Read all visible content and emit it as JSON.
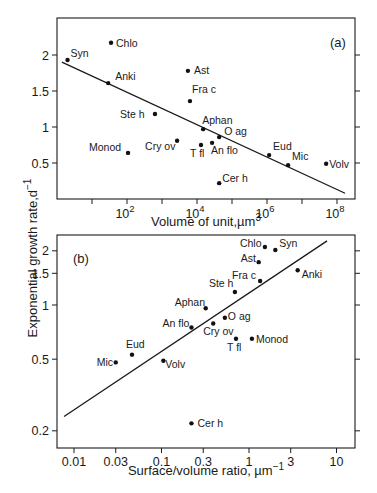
{
  "figure": {
    "y_axis_title": "Exponential growth rate,d",
    "y_axis_title_sup": "−1"
  },
  "chart_data": [
    {
      "type": "scatter",
      "panel": "(a)",
      "title": "",
      "xlabel": "Volume of unit,µm",
      "xlabel_sup": "3",
      "ylabel": "Exponential growth rate, d^-1",
      "xscale": "log",
      "yscale": "linear",
      "xlim_log10": [
        0.0,
        8.5
      ],
      "ylim": [
        0.05,
        2.5
      ],
      "x_ticks_log10": [
        1,
        2,
        3,
        4,
        5,
        6,
        7,
        8
      ],
      "x_tick_labels": [
        {
          "log10": 2,
          "base": "10",
          "exp": "2"
        },
        {
          "log10": 4,
          "base": "10",
          "exp": "4"
        },
        {
          "log10": 6,
          "base": "10",
          "exp": "6"
        },
        {
          "log10": 8,
          "base": "10",
          "exp": "8"
        }
      ],
      "y_ticks": [
        0.5,
        1,
        1.5,
        2
      ],
      "y_tick_labels": [
        "0.5",
        "1",
        "1.5",
        "2"
      ],
      "grid": false,
      "points": [
        {
          "label": "Syn",
          "volume_um3": 2,
          "rate": 1.93,
          "lx": 3,
          "ly": -3
        },
        {
          "label": "Chlo",
          "volume_um3": 35,
          "rate": 2.17,
          "lx": 5,
          "ly": 4
        },
        {
          "label": "Anki",
          "volume_um3": 29,
          "rate": 1.61,
          "lx": 7,
          "ly": -3
        },
        {
          "label": "Ste h",
          "volume_um3": 630,
          "rate": 1.18,
          "lx": -35,
          "ly": 4
        },
        {
          "label": "Monod",
          "volume_um3": 107,
          "rate": 0.64,
          "lx": -39,
          "ly": -2
        },
        {
          "label": "Cry ov",
          "volume_um3": 2700,
          "rate": 0.81,
          "lx": -32,
          "ly": 9
        },
        {
          "label": "Ast",
          "volume_um3": 5500,
          "rate": 1.78,
          "lx": 6,
          "ly": 3
        },
        {
          "label": "Fra c",
          "volume_um3": 6300,
          "rate": 1.36,
          "lx": 2,
          "ly": -8
        },
        {
          "label": "Aphan",
          "volume_um3": 15000,
          "rate": 0.97,
          "lx": -1,
          "ly": -5
        },
        {
          "label": "T fl",
          "volume_um3": 13000,
          "rate": 0.75,
          "lx": -11,
          "ly": 12
        },
        {
          "label": "An flo",
          "volume_um3": 27000,
          "rate": 0.78,
          "lx": -1,
          "ly": 11
        },
        {
          "label": "O ag",
          "volume_um3": 43000,
          "rate": 0.86,
          "lx": 5,
          "ly": -2
        },
        {
          "label": "Cer h",
          "volume_um3": 43000,
          "rate": 0.22,
          "lx": 3,
          "ly": -1
        },
        {
          "label": "Eud",
          "volume_um3": 1150000,
          "rate": 0.61,
          "lx": 4,
          "ly": -5
        },
        {
          "label": "Mic",
          "volume_um3": 4000000,
          "rate": 0.47,
          "lx": 4,
          "ly": -5
        },
        {
          "label": "Volv",
          "volume_um3": 49000000,
          "rate": 0.49,
          "lx": 3,
          "ly": 4
        }
      ],
      "regression": {
        "x_um3": [
          1.38,
          170000000
        ],
        "rate": [
          1.9,
          0.08
        ]
      }
    },
    {
      "type": "scatter",
      "panel": "(b)",
      "title": "",
      "xlabel": "Surface/volume ratio, µm",
      "xlabel_sup": "−1",
      "ylabel": "Exponential growth rate, d^-1",
      "xscale": "log",
      "yscale": "log",
      "xlim": [
        0.0055,
        13
      ],
      "ylim": [
        0.16,
        2.6
      ],
      "x_ticks": [
        0.01,
        0.03,
        0.1,
        0.3,
        1,
        3,
        10
      ],
      "x_tick_labels": [
        "0.01",
        "0.03",
        "0.1",
        "0.3",
        "1",
        "3",
        "10"
      ],
      "y_ticks": [
        0.2,
        0.5,
        1,
        1.5,
        2
      ],
      "y_tick_labels": [
        "0.2",
        "0.5",
        "1",
        "1.5",
        "2"
      ],
      "grid": false,
      "points": [
        {
          "label": "Chlo",
          "sv": 1.52,
          "rate": 2.1,
          "lx": -25,
          "ly": 0
        },
        {
          "label": "Syn",
          "sv": 2.0,
          "rate": 2.02,
          "lx": 4,
          "ly": -3
        },
        {
          "label": "Ast",
          "sv": 1.29,
          "rate": 1.73,
          "lx": -18,
          "ly": 0
        },
        {
          "label": "Anki",
          "sv": 3.6,
          "rate": 1.56,
          "lx": 4,
          "ly": 8
        },
        {
          "label": "Fra c",
          "sv": 1.34,
          "rate": 1.36,
          "lx": -28,
          "ly": -2
        },
        {
          "label": "Ste h",
          "sv": 0.69,
          "rate": 1.18,
          "lx": -26,
          "ly": -5
        },
        {
          "label": "Aphan",
          "sv": 0.32,
          "rate": 0.96,
          "lx": -31,
          "ly": -2
        },
        {
          "label": "O ag",
          "sv": 0.53,
          "rate": 0.85,
          "lx": 3,
          "ly": 2
        },
        {
          "label": "Cry ov",
          "sv": 0.39,
          "rate": 0.79,
          "lx": -10,
          "ly": 12
        },
        {
          "label": "An flo",
          "sv": 0.22,
          "rate": 0.75,
          "lx": -29,
          "ly": 0
        },
        {
          "label": "T fl",
          "sv": 0.71,
          "rate": 0.65,
          "lx": -9,
          "ly": 12
        },
        {
          "label": "Monod",
          "sv": 1.08,
          "rate": 0.65,
          "lx": 4,
          "ly": 4
        },
        {
          "label": "Volv",
          "sv": 0.105,
          "rate": 0.49,
          "lx": 2,
          "ly": 7
        },
        {
          "label": "Mic",
          "sv": 0.03,
          "rate": 0.48,
          "lx": -19,
          "ly": 4
        },
        {
          "label": "Eud",
          "sv": 0.046,
          "rate": 0.53,
          "lx": -6,
          "ly": -7
        },
        {
          "label": "Cer h",
          "sv": 0.22,
          "rate": 0.22,
          "lx": 6,
          "ly": 4
        }
      ],
      "regression": {
        "sv": [
          0.0077,
          7.8
        ],
        "rate": [
          0.24,
          2.27
        ]
      }
    }
  ]
}
